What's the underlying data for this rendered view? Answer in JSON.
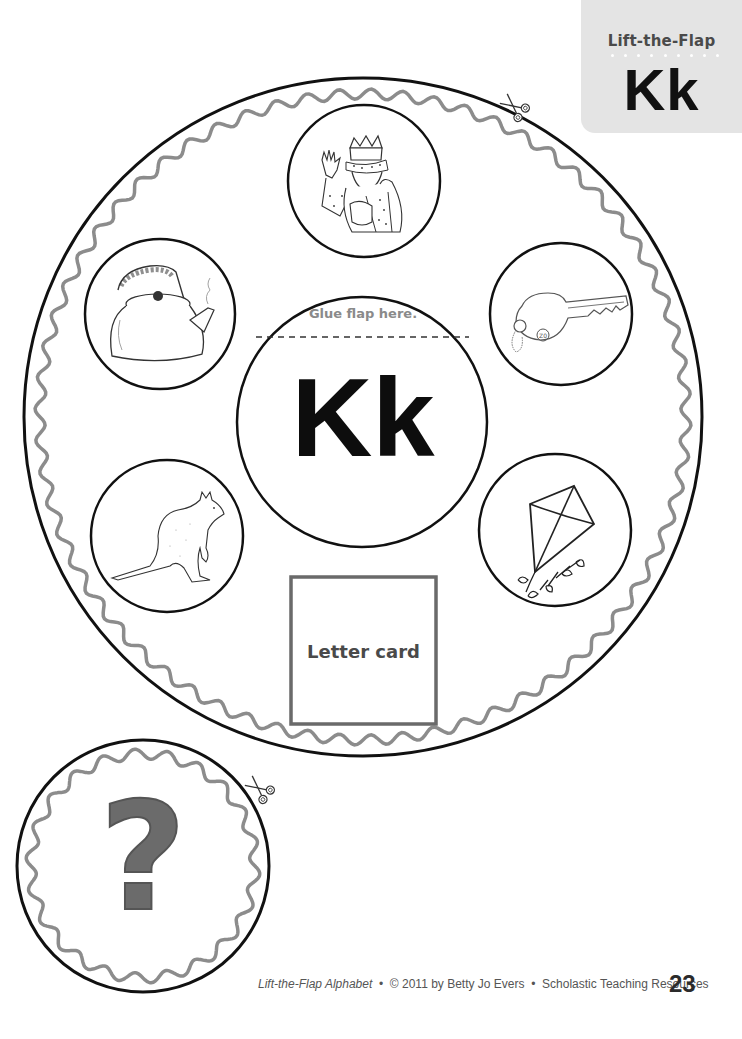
{
  "tab": {
    "title": "Lift-the-Flap",
    "letter": "Kk"
  },
  "main_circle": {
    "glue_label": "Glue flap here.",
    "center_letter": "Kk",
    "letter_card_label": "Letter card",
    "pictures": [
      {
        "name": "king",
        "position": "top"
      },
      {
        "name": "key",
        "position": "upper-right"
      },
      {
        "name": "kite",
        "position": "lower-right"
      },
      {
        "name": "kangaroo",
        "position": "lower-left"
      },
      {
        "name": "kettle",
        "position": "upper-left"
      }
    ]
  },
  "flap_circle": {
    "symbol": "?"
  },
  "icons": [
    "scissors-icon",
    "scissors-icon"
  ],
  "colors": {
    "outline": "#111111",
    "wavy_border": "#8c8c8c",
    "tab_background": "#e4e4e4",
    "question_mark": "#6b6b6b"
  },
  "footer": {
    "book_title": "Lift-the-Flap Alphabet",
    "separator": "•",
    "copyright": "© 2011 by Betty Jo Evers",
    "publisher": "Scholastic Teaching Resources",
    "page_number": "23"
  }
}
